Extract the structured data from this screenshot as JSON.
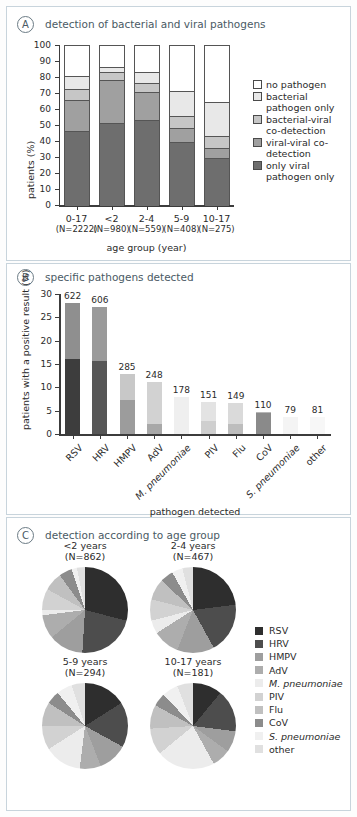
{
  "figure": {
    "panels": [
      {
        "tag": "A",
        "title": "detection of bacterial and viral pathogens"
      },
      {
        "tag": "B",
        "title": "specific pathogens detected"
      },
      {
        "tag": "C",
        "title": "detection according to age group"
      }
    ]
  },
  "chart_data": [
    {
      "id": "panelA",
      "type": "bar",
      "stacked": true,
      "title": "detection of bacterial and viral pathogens",
      "xlabel": "age group (year)",
      "ylabel": "patients (%)",
      "ylim": [
        0,
        100
      ],
      "yticks": [
        0,
        10,
        20,
        30,
        40,
        50,
        60,
        70,
        80,
        90,
        100
      ],
      "grid": false,
      "legend_position": "right",
      "categories": [
        "0-17",
        "<2",
        "2-4",
        "5-9",
        "10-17"
      ],
      "category_sublabels": [
        "(N=2222)",
        "(N=980)",
        "(N=559)",
        "(N=408)",
        "(N=275)"
      ],
      "series": [
        {
          "name": "only viral pathogen only",
          "color": "#6e6e6e",
          "values": [
            47,
            52,
            54,
            40,
            30
          ]
        },
        {
          "name": "viral-viral co-detection",
          "color": "#a0a0a0",
          "values": [
            19,
            27,
            17,
            9,
            6
          ]
        },
        {
          "name": "bacterial-viral co-detection",
          "color": "#c6c6c6",
          "values": [
            7,
            5,
            6,
            7,
            8
          ]
        },
        {
          "name": "bacterial pathogen only",
          "color": "#e8e8e8",
          "values": [
            8,
            3,
            7,
            16,
            21
          ]
        },
        {
          "name": "no pathogen",
          "color": "#ffffff",
          "values": [
            19,
            13,
            16,
            28,
            35
          ]
        }
      ],
      "legend": [
        {
          "label": "no pathogen",
          "color": "#ffffff"
        },
        {
          "label": "bacterial pathogen only",
          "color": "#e8e8e8"
        },
        {
          "label": "bacterial-viral co-detection",
          "color": "#c6c6c6"
        },
        {
          "label": "viral-viral co-detection",
          "color": "#a0a0a0"
        },
        {
          "label": "only viral pathogen only",
          "color": "#6e6e6e"
        }
      ]
    },
    {
      "id": "panelB",
      "type": "bar",
      "stacked": true,
      "title": "specific pathogens detected",
      "xlabel": "pathogen detected",
      "ylabel": "patients with a positive result (%)",
      "ylim": [
        0,
        30
      ],
      "yticks": [
        0,
        5,
        10,
        15,
        20,
        25,
        30
      ],
      "grid": false,
      "categories": [
        "RSV",
        "HRV",
        "HMPV",
        "AdV",
        "M. pneumoniae",
        "PIV",
        "Flu",
        "CoV",
        "S. pneumoniae",
        "other"
      ],
      "categories_italic": [
        false,
        false,
        false,
        false,
        true,
        false,
        false,
        false,
        true,
        false
      ],
      "data_labels": [
        "622",
        "606",
        "285",
        "248",
        "178",
        "151",
        "149",
        "110",
        "79",
        "81"
      ],
      "totals_pct": [
        28.0,
        27.3,
        12.8,
        11.2,
        8.0,
        6.8,
        6.7,
        4.7,
        3.6,
        3.6
      ],
      "series": [
        {
          "name": "single detection",
          "values": [
            16.0,
            15.7,
            7.2,
            2.2,
            0.0,
            2.8,
            2.2,
            4.4,
            0.0,
            0.0
          ]
        },
        {
          "name": "co-detection",
          "values": [
            12.0,
            11.6,
            5.6,
            9.0,
            8.0,
            4.0,
            4.5,
            0.3,
            3.6,
            3.6
          ]
        }
      ],
      "bar_colors": [
        "#3d3d3d",
        "#575757",
        "#9c9c9c",
        "#a8a8a8",
        "#e2e2e2",
        "#cfcfcf",
        "#bdbdbd",
        "#8a8a8a",
        "#eaeaea",
        "#f1f1f1"
      ],
      "bar_colors_light": [
        "#8f8f8f",
        "#9a9a9a",
        "#c8c8c8",
        "#d2d2d2",
        "#efefef",
        "#e3e3e3",
        "#dadada",
        "#b6b6b6",
        "#f4f4f4",
        "#f7f7f7"
      ]
    },
    {
      "id": "panelC",
      "type": "pie",
      "title": "detection according to age group",
      "legend_position": "right",
      "legend": [
        {
          "label": "RSV",
          "color": "#2e2e2e",
          "italic": false
        },
        {
          "label": "HRV",
          "color": "#4d4d4d",
          "italic": false
        },
        {
          "label": "HMPV",
          "color": "#9e9e9e",
          "italic": false
        },
        {
          "label": "AdV",
          "color": "#adadad",
          "italic": false
        },
        {
          "label": "M. pneumoniae",
          "color": "#ececec",
          "italic": true
        },
        {
          "label": "PIV",
          "color": "#d2d2d2",
          "italic": false
        },
        {
          "label": "Flu",
          "color": "#c0c0c0",
          "italic": false
        },
        {
          "label": "CoV",
          "color": "#8c8c8c",
          "italic": false
        },
        {
          "label": "S. pneumoniae",
          "color": "#f0f0f0",
          "italic": true
        },
        {
          "label": "other",
          "color": "#e0e0e0",
          "italic": false
        }
      ],
      "pies": [
        {
          "title": "<2 years",
          "subtitle": "(N=862)",
          "labels": [
            "RSV",
            "HRV",
            "HMPV",
            "AdV",
            "M. pneumoniae",
            "PIV",
            "Flu",
            "CoV",
            "S. pneumoniae",
            "other"
          ],
          "values": [
            29,
            22,
            13,
            9,
            2,
            8,
            7,
            5,
            2,
            3
          ]
        },
        {
          "title": "2-4 years",
          "subtitle": "(N=467)",
          "labels": [
            "RSV",
            "HRV",
            "HMPV",
            "AdV",
            "M. pneumoniae",
            "PIV",
            "Flu",
            "CoV",
            "S. pneumoniae",
            "other"
          ],
          "values": [
            23,
            19,
            14,
            10,
            5,
            8,
            8,
            5,
            4,
            4
          ]
        },
        {
          "title": "5-9 years",
          "subtitle": "(N=294)",
          "labels": [
            "RSV",
            "HRV",
            "HMPV",
            "AdV",
            "M. pneumoniae",
            "PIV",
            "Flu",
            "CoV",
            "S. pneumoniae",
            "other"
          ],
          "values": [
            16,
            17,
            11,
            8,
            14,
            9,
            9,
            5,
            6,
            5
          ]
        },
        {
          "title": "10-17 years",
          "subtitle": "(N=181)",
          "labels": [
            "RSV",
            "HRV",
            "HMPV",
            "AdV",
            "M. pneumoniae",
            "PIV",
            "Flu",
            "CoV",
            "S. pneumoniae",
            "other"
          ],
          "values": [
            11,
            16,
            8,
            7,
            22,
            10,
            9,
            5,
            6,
            6
          ]
        }
      ]
    }
  ]
}
